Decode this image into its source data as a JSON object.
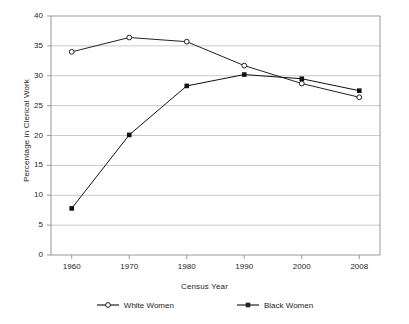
{
  "chart_data": {
    "type": "line",
    "title": "",
    "xlabel": "Census Year",
    "ylabel": "Percentage in Clerical Work",
    "categories": [
      "1960",
      "1970",
      "1980",
      "1990",
      "2000",
      "2008"
    ],
    "x": [
      1960,
      1970,
      1980,
      1990,
      2000,
      2008
    ],
    "ylim": [
      0,
      40
    ],
    "yticks": [
      0,
      5,
      10,
      15,
      20,
      25,
      30,
      35,
      40
    ],
    "ytick_labels": [
      "0",
      "5",
      "10",
      "15",
      "20",
      "25",
      "30",
      "35",
      "40"
    ],
    "grid": "horizontal",
    "legend_position": "bottom",
    "series": [
      {
        "name": "White Women",
        "marker": "open-circle",
        "color": "#222222",
        "values": [
          34.0,
          36.4,
          35.7,
          31.7,
          28.7,
          26.4
        ]
      },
      {
        "name": "Black Women",
        "marker": "filled-square",
        "color": "#111111",
        "values": [
          7.8,
          20.1,
          28.3,
          30.2,
          29.5,
          27.5
        ]
      }
    ]
  },
  "legend": {
    "items": [
      {
        "label": "White Women",
        "marker": "open-circle"
      },
      {
        "label": "Black Women",
        "marker": "filled-square"
      }
    ]
  },
  "colors": {
    "line": "#222222",
    "grid": "#c9c9c9",
    "axis": "#8a8a8a",
    "text": "#1d1d1d",
    "background": "#ffffff"
  }
}
